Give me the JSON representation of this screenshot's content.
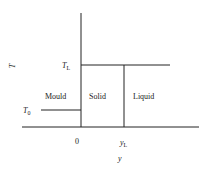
{
  "diagram": {
    "axes": {
      "y_axis_label": "T",
      "x_axis_label": "y"
    },
    "ticks": {
      "x_origin": "0",
      "x_interface_main": "y",
      "x_interface_sub": "L"
    },
    "levels": {
      "liquidus_main": "T",
      "liquidus_sub": "L",
      "mould_temp_main": "T",
      "mould_temp_sub": "0"
    },
    "regions": {
      "mould": "Mould",
      "solid": "Solid",
      "liquid": "Liquid"
    },
    "colors": {
      "line": "#222222",
      "background": "#ffffff"
    }
  }
}
